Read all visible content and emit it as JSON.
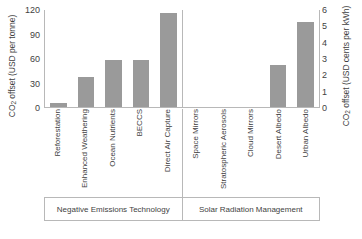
{
  "chart_data": {
    "type": "bar",
    "title": "",
    "subtitle": "",
    "xlabel": "",
    "ylabel": "CO2 offset (USD per tonne)",
    "ylabel_left_prefix": "CO",
    "ylabel_left_sub": "2",
    "ylabel_left_rest": " offset (USD per tonne)",
    "ylabel_right_prefix": "CO",
    "ylabel_right_sub": "2",
    "ylabel_right_rest": " offset (USD cents per kWh)",
    "ylabel_right": "CO2 offset (USD cents per kWh)",
    "grid": false,
    "legend": "none",
    "axes": [
      {
        "id": "left",
        "label": "CO2 offset (USD per tonne)",
        "ticks": [
          0,
          30,
          60,
          90,
          120
        ],
        "ylim": [
          0,
          120
        ],
        "applies_to_group": "Negative Emissions Technology"
      },
      {
        "id": "right",
        "label": "CO2 offset (USD cents per kWh)",
        "ticks": [
          0,
          1,
          2,
          3,
          4,
          5,
          6
        ],
        "ylim": [
          0,
          6
        ],
        "applies_to_group": "Solar Radiation Management"
      }
    ],
    "groups": [
      {
        "name": "Negative Emissions Technology",
        "axis": "left",
        "categories": [
          "Reforestation",
          "Enhanced Weathering",
          "Ocean Nutrients",
          "BECCS",
          "Direct Air Capture"
        ],
        "values": [
          5,
          37,
          58,
          58,
          115
        ]
      },
      {
        "name": "Solar Radiation Management",
        "axis": "right",
        "categories": [
          "Space Mirrors",
          "Stratospheric Aerosols",
          "Cloud Mirrors",
          "Desert Albedo",
          "Urban Albedo"
        ],
        "values": [
          0,
          0,
          0,
          2.6,
          5.2
        ]
      }
    ],
    "categories": [
      "Reforestation",
      "Enhanced Weathering",
      "Ocean Nutrients",
      "BECCS",
      "Direct Air Capture",
      "Space Mirrors",
      "Stratospheric Aerosols",
      "Cloud Mirrors",
      "Desert Albedo",
      "Urban Albedo"
    ],
    "values": [
      5,
      37,
      58,
      58,
      115,
      0,
      0,
      0,
      2.6,
      5.2
    ],
    "colors": {
      "bar": "#9a9a9a",
      "axis": "#b8b8b8",
      "text": "#3f3f3f",
      "background": "#ffffff"
    }
  }
}
